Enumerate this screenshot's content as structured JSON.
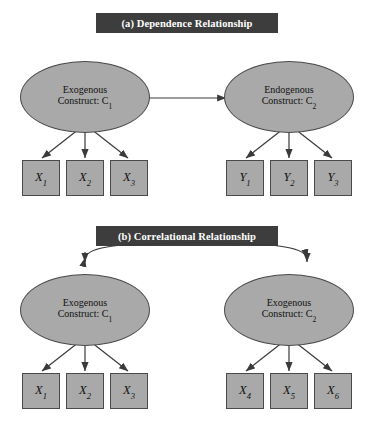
{
  "figure": {
    "background_color": "#ffffff",
    "node_fill_color": "#a9a9a9",
    "node_border_color": "#4a4a4a",
    "title_bar_color": "#3d3d3d",
    "title_text_color": "#ffffff",
    "edge_color": "#3a3a3a"
  },
  "panels": [
    {
      "id": "a",
      "title": "(a) Dependence Relationship",
      "constructs": [
        {
          "id": "a-left",
          "line1": "Exogenous",
          "line2_prefix": "Construct: C",
          "line2_subscript": "1"
        },
        {
          "id": "a-right",
          "line1": "Endogenous",
          "line2_prefix": "Construct: C",
          "line2_subscript": "2"
        }
      ],
      "indicators_left": [
        {
          "base": "X",
          "sub": "1"
        },
        {
          "base": "X",
          "sub": "2"
        },
        {
          "base": "X",
          "sub": "3"
        }
      ],
      "indicators_right": [
        {
          "base": "Y",
          "sub": "1"
        },
        {
          "base": "Y",
          "sub": "2"
        },
        {
          "base": "Y",
          "sub": "3"
        }
      ],
      "relationship_arrow": "single-headed-straight"
    },
    {
      "id": "b",
      "title": "(b) Correlational Relationship",
      "constructs": [
        {
          "id": "b-left",
          "line1": "Exogenous",
          "line2_prefix": "Construct: C",
          "line2_subscript": "1"
        },
        {
          "id": "b-right",
          "line1": "Exogenous",
          "line2_prefix": "Construct: C",
          "line2_subscript": "2"
        }
      ],
      "indicators_left": [
        {
          "base": "X",
          "sub": "1"
        },
        {
          "base": "X",
          "sub": "2"
        },
        {
          "base": "X",
          "sub": "3"
        }
      ],
      "indicators_right": [
        {
          "base": "X",
          "sub": "4"
        },
        {
          "base": "X",
          "sub": "5"
        },
        {
          "base": "X",
          "sub": "6"
        }
      ],
      "relationship_arrow": "double-headed-curved"
    }
  ]
}
